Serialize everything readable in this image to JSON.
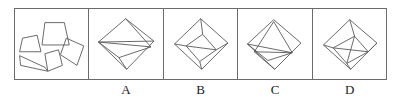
{
  "question": {
    "type": "figure-assembly",
    "prompt_panel_label": "",
    "option_labels": [
      "",
      "A",
      "B",
      "C",
      "D"
    ],
    "stroke_color": "#555555",
    "frame_color": "#6b6b6b",
    "background_color": "#ffffff",
    "panel_count": 5
  },
  "panels": [
    {
      "id": "pieces",
      "name": "scattered-pieces-panel",
      "label": "",
      "description": "Five separate flat polygon pieces shown unassembled",
      "shapes": [
        {
          "name": "piece-trapezoid-left",
          "points": "7,30 22,27 26,44 4,44"
        },
        {
          "name": "piece-trapezoid-top",
          "points": "30,14 50,14 55,37 27,37"
        },
        {
          "name": "piece-quadrilateral-right",
          "points": "52,30 70,38 63,58 46,47"
        },
        {
          "name": "piece-thin-triangle",
          "points": "4,48 30,60 33,64 5,58"
        },
        {
          "name": "piece-parallelogram-bottom",
          "points": "30,46 44,42 48,58 33,64"
        }
      ]
    },
    {
      "id": "A",
      "name": "option-a-panel",
      "label": "A",
      "description": "Diamond outline crossed by a horizontal line and thin diagonal slivers",
      "shapes": [
        {
          "name": "diamond-outline",
          "points": "37,10 66,33 38,62 9,34"
        },
        {
          "name": "inner-line-1",
          "points": "9,34 66,33",
          "open": true
        },
        {
          "name": "inner-line-2",
          "points": "9,34 63,39",
          "open": true
        },
        {
          "name": "inner-line-3",
          "points": "63,39 30,50",
          "open": true
        },
        {
          "name": "inner-line-4",
          "points": "30,50 9,34",
          "open": true
        },
        {
          "name": "inner-line-5",
          "points": "37,10 63,39",
          "open": true
        },
        {
          "name": "inner-line-6",
          "points": "30,50 38,62",
          "open": true
        }
      ]
    },
    {
      "id": "B",
      "name": "option-b-panel",
      "label": "B",
      "description": "Diamond outline containing an inscribed tilted square and wedge divisions",
      "shapes": [
        {
          "name": "diamond-outline",
          "points": "37,10 65,35 38,62 10,36"
        },
        {
          "name": "inner-square",
          "points": "22,38 39,26 53,42 36,54"
        },
        {
          "name": "inner-line-1",
          "points": "37,10 39,26",
          "open": true
        },
        {
          "name": "inner-line-2",
          "points": "10,36 22,38",
          "open": true
        },
        {
          "name": "inner-line-3",
          "points": "65,35 53,42",
          "open": true
        },
        {
          "name": "inner-line-4",
          "points": "38,62 36,54",
          "open": true
        },
        {
          "name": "inner-line-5",
          "points": "22,38 53,42",
          "open": true
        }
      ]
    },
    {
      "id": "C",
      "name": "option-c-panel",
      "label": "C",
      "description": "Diamond outline containing a central triangle and flat slivers near the base",
      "shapes": [
        {
          "name": "diamond-outline",
          "points": "36,11 64,35 37,62 9,36"
        },
        {
          "name": "inner-triangle",
          "points": "36,13 55,45 16,44"
        },
        {
          "name": "inner-line-1",
          "points": "9,36 55,45",
          "open": true
        },
        {
          "name": "inner-line-2",
          "points": "16,44 37,62",
          "open": true
        },
        {
          "name": "inner-line-3",
          "points": "55,45 30,53",
          "open": true
        },
        {
          "name": "inner-line-4",
          "points": "30,53 9,36",
          "open": true
        }
      ]
    },
    {
      "id": "D",
      "name": "option-d-panel",
      "label": "D",
      "description": "Diamond outline with an inscribed square rotated and split by short chords",
      "shapes": [
        {
          "name": "diamond-outline",
          "points": "37,11 65,35 38,62 10,37"
        },
        {
          "name": "inner-square",
          "points": "20,40 42,28 56,44 34,56"
        },
        {
          "name": "inner-line-1",
          "points": "37,11 42,28",
          "open": true
        },
        {
          "name": "inner-line-2",
          "points": "10,37 20,40",
          "open": true
        },
        {
          "name": "inner-line-3",
          "points": "65,35 56,44",
          "open": true
        },
        {
          "name": "inner-line-4",
          "points": "38,62 34,56",
          "open": true
        },
        {
          "name": "inner-line-5",
          "points": "20,40 56,44",
          "open": true
        },
        {
          "name": "inner-line-6",
          "points": "42,28 34,56",
          "open": true
        }
      ]
    }
  ]
}
